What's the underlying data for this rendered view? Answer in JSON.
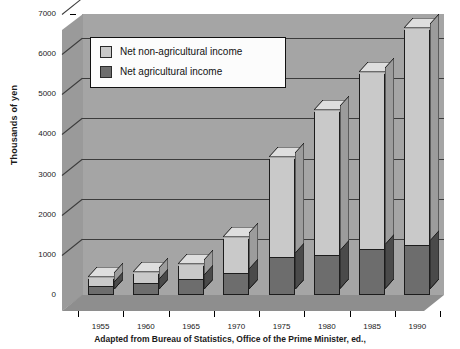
{
  "chart_data": {
    "type": "bar",
    "subtype": "stacked-3d-column",
    "title": "",
    "xlabel": "",
    "ylabel": "Thousands of yen",
    "ylim": [
      0,
      7000
    ],
    "ytick_step": 1000,
    "yticks": [
      "0",
      "1000",
      "2000",
      "3000",
      "4000",
      "5000",
      "6000",
      "7000"
    ],
    "grid": true,
    "legend_position": "top-left-inside",
    "categories": [
      "1955",
      "1960",
      "1965",
      "1970",
      "1975",
      "1980",
      "1985",
      "1990"
    ],
    "series": [
      {
        "name": "Net agricultural income",
        "color": "#6d6d6d",
        "values": [
          180,
          250,
          350,
          500,
          900,
          950,
          1100,
          1200
        ]
      },
      {
        "name": "Net non-agricultural income",
        "color": "#c9c9c9",
        "values": [
          230,
          280,
          380,
          900,
          2500,
          3600,
          4400,
          5400
        ]
      }
    ],
    "totals": [
      410,
      530,
      730,
      1400,
      3400,
      4550,
      5500,
      6600
    ],
    "caption": "Adapted from Bureau of Statistics, Office of the Prime Minister, ed.,"
  },
  "legend": {
    "items": [
      {
        "label": "Net non-agricultural income",
        "swatch": "#c9c9c9"
      },
      {
        "label": "Net agricultural income",
        "swatch": "#6d6d6d"
      }
    ]
  },
  "colors": {
    "wall_back": "#a5a5a5",
    "wall_left": "#9a9a9a",
    "floor": "#8e8e8e",
    "bar_light": "#c9c9c9",
    "bar_light_side": "#9c9c9c",
    "bar_light_top": "#dedede",
    "bar_dark": "#6d6d6d",
    "bar_dark_side": "#4a4a4a",
    "outline": "#1c1c1c",
    "gridline": "#3c3c3c",
    "text": "#1a1a1a"
  }
}
